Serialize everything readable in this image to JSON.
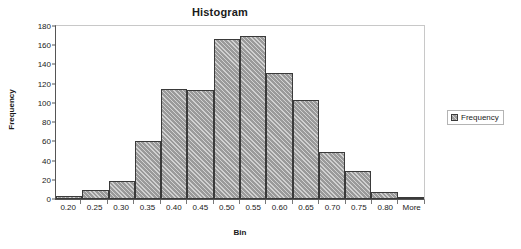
{
  "chart_data": {
    "type": "bar",
    "title": "Histogram",
    "xlabel": "Bin",
    "ylabel": "Frequency",
    "categories": [
      "0.20",
      "0.25",
      "0.30",
      "0.35",
      "0.40",
      "0.45",
      "0.50",
      "0.55",
      "0.60",
      "0.65",
      "0.70",
      "0.75",
      "0.80",
      "More"
    ],
    "values": [
      3,
      9,
      19,
      60,
      113,
      112,
      165,
      168,
      130,
      102,
      48,
      29,
      7,
      2
    ],
    "series": [
      {
        "name": "Frequency",
        "values": [
          3,
          9,
          19,
          60,
          113,
          112,
          165,
          168,
          130,
          102,
          48,
          29,
          7,
          2
        ]
      }
    ],
    "ylim": [
      0,
      180
    ],
    "y_ticks": [
      0,
      20,
      40,
      60,
      80,
      100,
      120,
      140,
      160,
      180
    ],
    "grid": false,
    "legend_position": "right",
    "legend_entries": [
      "Frequency"
    ],
    "bar_color": "#9a9a9a",
    "bar_border_color": "#3a3a3a",
    "axis_color": "#555555",
    "plot_background": "#ffffff"
  },
  "legend": {
    "label": "Frequency"
  }
}
